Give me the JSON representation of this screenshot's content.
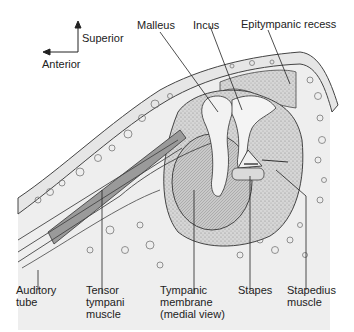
{
  "figure": {
    "orientation": {
      "superior": "Superior",
      "anterior": "Anterior"
    },
    "labels_top": [
      {
        "id": "malleus",
        "text": "Malleus"
      },
      {
        "id": "incus",
        "text": "Incus"
      },
      {
        "id": "epitympanic_recess",
        "text": "Epitympanic recess"
      }
    ],
    "labels_bottom": [
      {
        "id": "auditory_tube",
        "lines": [
          "Auditory",
          "tube"
        ]
      },
      {
        "id": "tensor_tympani",
        "lines": [
          "Tensor",
          "tympani",
          "muscle"
        ]
      },
      {
        "id": "tympanic_membrane",
        "lines": [
          "Tympanic",
          "membrane",
          "(medial view)"
        ]
      },
      {
        "id": "stapes",
        "lines": [
          "Stapes"
        ]
      },
      {
        "id": "stapedius",
        "lines": [
          "Stapedius",
          "muscle"
        ]
      }
    ],
    "colors": {
      "outline": "#333333",
      "bone_fill": "#ececec",
      "cavity_fill": "#dcdcdc",
      "muscle_fill": "#9a9a9a",
      "ossicle_fill": "#f2f2f2",
      "membrane_fill": "#c8c8c8"
    }
  }
}
